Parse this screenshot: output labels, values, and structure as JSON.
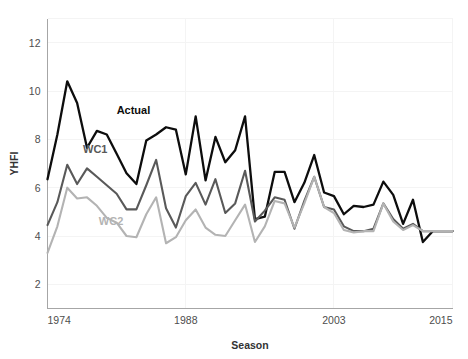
{
  "chart_data": {
    "type": "line",
    "title": "",
    "xlabel": "Season",
    "ylabel": "YHFI",
    "xlim": [
      1974,
      2015
    ],
    "ylim": [
      1,
      13
    ],
    "grid": true,
    "legend": "inline-labels",
    "y_ticks": [
      "2",
      "4",
      "6",
      "8",
      "10",
      "12"
    ],
    "y_tick_values": [
      2,
      4,
      6,
      8,
      10,
      12
    ],
    "x_ticks": [
      "1974",
      "1988",
      "2003",
      "2015"
    ],
    "x_tick_values": [
      1974,
      1988,
      2003,
      2015
    ],
    "x": [
      1974,
      1975,
      1976,
      1977,
      1978,
      1979,
      1980,
      1981,
      1982,
      1983,
      1984,
      1985,
      1986,
      1987,
      1988,
      1989,
      1990,
      1991,
      1992,
      1993,
      1994,
      1995,
      1996,
      1997,
      1998,
      1999,
      2000,
      2001,
      2002,
      2003,
      2004,
      2005,
      2006,
      2007,
      2008,
      2009,
      2010,
      2011,
      2012,
      2013,
      2014,
      2015
    ],
    "series": [
      {
        "name": "Actual",
        "color": "#0d0d0d",
        "width": 2.3,
        "label_x": 1981.0,
        "label_y": 9.05,
        "values": [
          6.35,
          8.2,
          10.4,
          9.5,
          7.65,
          8.35,
          8.2,
          7.4,
          6.6,
          6.15,
          7.95,
          8.2,
          8.5,
          8.4,
          6.55,
          8.95,
          6.3,
          8.1,
          7.05,
          7.55,
          8.95,
          4.7,
          4.8,
          6.65,
          6.65,
          5.4,
          6.2,
          7.35,
          5.8,
          5.65,
          4.9,
          5.25,
          5.2,
          5.3,
          6.25,
          5.7,
          4.5,
          5.5,
          3.75,
          4.2,
          4.2,
          4.2
        ]
      },
      {
        "name": "WC1",
        "color": "#595959",
        "width": 2.1,
        "label_x": 1977.6,
        "label_y": 7.45,
        "values": [
          4.45,
          5.4,
          6.95,
          6.15,
          6.8,
          6.45,
          6.1,
          5.75,
          5.1,
          5.1,
          6.1,
          7.15,
          5.15,
          4.35,
          5.65,
          6.2,
          5.3,
          6.35,
          4.95,
          5.35,
          6.7,
          4.6,
          5.05,
          5.6,
          5.5,
          4.3,
          5.45,
          6.45,
          5.2,
          5.1,
          4.4,
          4.2,
          4.2,
          4.3,
          5.35,
          4.7,
          4.3,
          4.5,
          4.2,
          4.2,
          4.2,
          4.2
        ]
      },
      {
        "name": "WC2",
        "color": "#b3b3b3",
        "width": 2.1,
        "label_x": 1979.2,
        "label_y": 4.45,
        "values": [
          3.3,
          4.4,
          6.0,
          5.55,
          5.6,
          5.25,
          4.75,
          4.55,
          4.0,
          3.95,
          4.9,
          5.6,
          3.7,
          3.95,
          4.65,
          5.1,
          4.35,
          4.05,
          4.0,
          4.65,
          5.3,
          3.75,
          4.4,
          5.45,
          5.35,
          4.35,
          5.35,
          6.45,
          5.2,
          4.95,
          4.25,
          4.15,
          4.2,
          4.2,
          5.35,
          4.6,
          4.25,
          4.45,
          4.2,
          4.2,
          4.2,
          4.2
        ]
      }
    ]
  }
}
